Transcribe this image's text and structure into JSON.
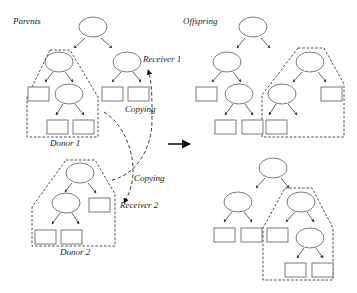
{
  "diagram": {
    "labels": {
      "parents": "Parents",
      "offspring": "Offspring",
      "receiver1": "Receiver 1",
      "receiver2": "Receiver 2",
      "donor1": "Donor 1",
      "donor2": "Donor 2",
      "copying_top": "Copying",
      "copying_bottom": "Copying"
    },
    "colors": {
      "stroke": "#6b6b6b",
      "edge": "#3a3a3a",
      "background": "#ffffff"
    },
    "trees": [
      {
        "name": "parent-1",
        "ellipses": [
          [
            93,
            27
          ],
          [
            59,
            62
          ],
          [
            127,
            62
          ],
          [
            69,
            94
          ]
        ],
        "rects": [
          [
            28,
            87
          ],
          [
            47,
            120
          ],
          [
            73,
            120
          ],
          [
            102,
            87
          ],
          [
            128,
            87
          ]
        ],
        "edges": [
          [
            85,
            38,
            74,
            48
          ],
          [
            101,
            38,
            112,
            48
          ],
          [
            53,
            72,
            45,
            82
          ],
          [
            65,
            72,
            73,
            82
          ],
          [
            121,
            72,
            112,
            82
          ],
          [
            133,
            72,
            141,
            82
          ],
          [
            63,
            104,
            56,
            115
          ],
          [
            75,
            104,
            84,
            115
          ]
        ],
        "region": "50,50 70,50 98,97 98,137 27,137 27,97"
      },
      {
        "name": "parent-2",
        "ellipses": [
          [
            80,
            173
          ],
          [
            66,
            203
          ]
        ],
        "rects": [
          [
            89,
            198
          ],
          [
            35,
            230
          ],
          [
            61,
            230
          ]
        ],
        "edges": [
          [
            72,
            183,
            65,
            192
          ],
          [
            88,
            183,
            96,
            193
          ],
          [
            60,
            213,
            52,
            224
          ],
          [
            72,
            213,
            79,
            224
          ]
        ],
        "region": "66,160 95,160 115,194 115,246 32,246 32,207"
      },
      {
        "name": "offspring-1",
        "ellipses": [
          [
            253,
            27
          ],
          [
            227,
            62
          ],
          [
            310,
            62
          ],
          [
            239,
            94
          ],
          [
            282,
            94
          ]
        ],
        "rects": [
          [
            196,
            87
          ],
          [
            215,
            120
          ],
          [
            242,
            120
          ],
          [
            266,
            120
          ],
          [
            321,
            87
          ]
        ],
        "edges": [
          [
            245,
            38,
            237,
            48
          ],
          [
            261,
            38,
            270,
            48
          ],
          [
            221,
            72,
            212,
            82
          ],
          [
            233,
            72,
            241,
            82
          ],
          [
            233,
            104,
            225,
            115
          ],
          [
            245,
            104,
            253,
            115
          ],
          [
            302,
            72,
            293,
            82
          ],
          [
            318,
            72,
            326,
            82
          ],
          [
            276,
            104,
            269,
            115
          ],
          [
            288,
            104,
            297,
            115
          ]
        ],
        "region": "298,48 324,48 344,84 344,137 262,137 262,95"
      },
      {
        "name": "offspring-2",
        "ellipses": [
          [
            273,
            168
          ],
          [
            238,
            202
          ],
          [
            301,
            202
          ],
          [
            310,
            238
          ]
        ],
        "rects": [
          [
            214,
            228
          ],
          [
            241,
            228
          ],
          [
            267,
            228
          ],
          [
            285,
            263
          ],
          [
            312,
            263
          ]
        ],
        "edges": [
          [
            265,
            178,
            256,
            188
          ],
          [
            281,
            178,
            289,
            188
          ],
          [
            232,
            212,
            224,
            222
          ],
          [
            244,
            212,
            252,
            222
          ],
          [
            295,
            212,
            286,
            222
          ],
          [
            307,
            212,
            314,
            222
          ],
          [
            304,
            248,
            297,
            258
          ],
          [
            316,
            248,
            323,
            258
          ]
        ],
        "region": "285,188 312,188 333,228 333,280 263,280 263,228"
      }
    ],
    "node_size": {
      "ellipse_rx": 14,
      "ellipse_ry": 10,
      "rect_w": 21,
      "rect_h": 14
    },
    "copying_paths": [
      {
        "name": "copy-donor1-to-receiver2",
        "d": "M 104,112 C 130,128 140,170 128,195 L 124,203",
        "arrow": [
          124,
          203
        ]
      },
      {
        "name": "copy-donor2-to-receiver1",
        "d": "M 112,180 C 135,175 152,150 152,120 C 152,95 152,82 148,70",
        "arrow": [
          148,
          68
        ]
      }
    ],
    "main_arrow": {
      "x1": 168,
      "y1": 144,
      "x2": 190,
      "y2": 144
    }
  }
}
